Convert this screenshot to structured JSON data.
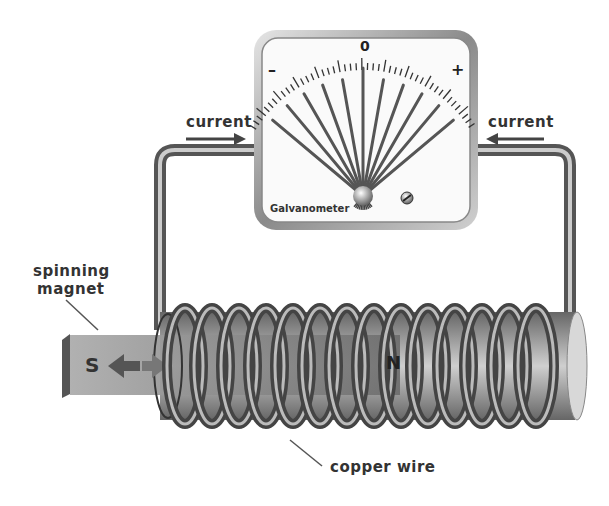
{
  "diagram": {
    "galvanometer": {
      "label": "Galvanometer",
      "scale_zero": "0",
      "scale_minus": "–",
      "scale_plus": "+",
      "needle_count": 11
    },
    "labels": {
      "current_left": "current",
      "current_right": "current",
      "spinning_magnet_line1": "spinning",
      "spinning_magnet_line2": "magnet",
      "copper_wire": "copper wire"
    },
    "magnet": {
      "south_pole": "S",
      "north_pole": "N"
    },
    "coil": {
      "loop_count": 14
    },
    "colors": {
      "wire": "#777777",
      "wire_highlight": "#d9d9d9",
      "text": "#333333",
      "meter_frame": "#9a9a9a",
      "magnet": "#8a8a8a"
    }
  }
}
